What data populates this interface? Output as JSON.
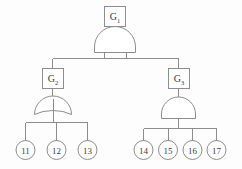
{
  "diagram": {
    "type": "fault-tree",
    "title": "",
    "colors": {
      "stroke": "#8d8d8d",
      "fill": "#ffffff",
      "text": "#3a3a3a",
      "background": "#fdfdfd"
    },
    "top_event": {
      "id": "G1",
      "label_base": "G",
      "label_sub": "1",
      "shape": "rectangle"
    },
    "gates": [
      {
        "id": "gate-top",
        "kind": "AND",
        "parent_event": "G1",
        "children": [
          "G2",
          "G3"
        ]
      },
      {
        "id": "gate-left",
        "kind": "OR",
        "parent_event": "G2",
        "children": [
          "11",
          "12",
          "13"
        ]
      },
      {
        "id": "gate-right",
        "kind": "AND",
        "parent_event": "G3",
        "children": [
          "14",
          "15",
          "16",
          "17"
        ]
      }
    ],
    "intermediate_events": [
      {
        "id": "G2",
        "label_base": "G",
        "label_sub": "2",
        "shape": "rectangle",
        "branch": "left"
      },
      {
        "id": "G3",
        "label_base": "G",
        "label_sub": "3",
        "shape": "rectangle",
        "branch": "right"
      }
    ],
    "basic_events_left": [
      {
        "id": "11",
        "label": "11",
        "shape": "circle"
      },
      {
        "id": "12",
        "label": "12",
        "shape": "circle"
      },
      {
        "id": "13",
        "label": "13",
        "shape": "circle"
      }
    ],
    "basic_events_right": [
      {
        "id": "14",
        "label": "14",
        "shape": "circle"
      },
      {
        "id": "15",
        "label": "15",
        "shape": "circle"
      },
      {
        "id": "16",
        "label": "16",
        "shape": "circle"
      },
      {
        "id": "17",
        "label": "17",
        "shape": "circle"
      }
    ]
  }
}
